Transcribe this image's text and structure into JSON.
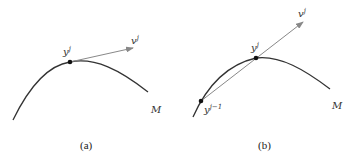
{
  "panels": [
    {
      "id": "a",
      "caption": "(a)",
      "point_label": "y",
      "point_sup": "j",
      "vector_label": "v",
      "vector_sup": "j",
      "manifold_label": "M"
    },
    {
      "id": "b",
      "caption": "(b)",
      "point_label": "y",
      "point_sup": "j",
      "prev_point_label": "y",
      "prev_point_sup": "j−1",
      "vector_label": "v",
      "vector_sup": "j",
      "manifold_label": "M"
    }
  ],
  "colors": {
    "curve": "#333333",
    "vector": "#888888",
    "point": "#111111"
  }
}
